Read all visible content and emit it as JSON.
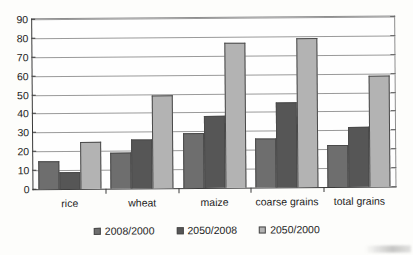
{
  "chart_data": {
    "type": "bar",
    "title": "",
    "subtitle": "",
    "xlabel": "",
    "ylabel": "",
    "ylim": [
      0,
      90
    ],
    "ytick_step": 10,
    "yticks": [
      90,
      80,
      70,
      60,
      50,
      40,
      30,
      20,
      10,
      0
    ],
    "grid": true,
    "grid_axis": "y",
    "legend_position": "bottom-center",
    "categories": [
      "rice",
      "wheat",
      "maize",
      "coarse grains",
      "total grains"
    ],
    "series": [
      {
        "name": "2008/2000",
        "color": "#6e6e6e",
        "values": [
          15,
          19,
          29,
          26,
          22
        ]
      },
      {
        "name": "2050/2008",
        "color": "#565656",
        "values": [
          9,
          26,
          38,
          45,
          32
        ]
      },
      {
        "name": "2050/2000",
        "color": "#b3b3b3",
        "values": [
          25,
          49,
          77,
          79,
          59
        ]
      }
    ]
  }
}
